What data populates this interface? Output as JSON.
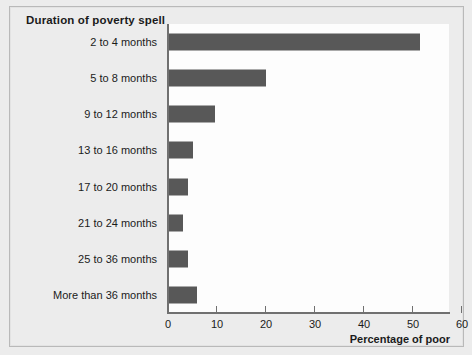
{
  "chart_data": {
    "type": "bar",
    "orientation": "horizontal",
    "title": "Duration of poverty spell",
    "xlabel": "Percentage of poor",
    "ylabel": "",
    "categories": [
      "2 to 4 months",
      "5 to 8 months",
      "9 to 12 months",
      "13 to 16 months",
      "17 to 20 months",
      "21 to 24 months",
      "25 to 36 months",
      "More than 36 months"
    ],
    "values": [
      51.5,
      20,
      9.5,
      5,
      4,
      3,
      4,
      6
    ],
    "xlim": [
      0,
      60
    ],
    "xticks": [
      0,
      10,
      20,
      30,
      40,
      50,
      60
    ],
    "xtick_labels": [
      "0",
      "10",
      "20",
      "30",
      "40",
      "50",
      "60"
    ],
    "grid": false,
    "legend": null,
    "bar_color": "#585858",
    "plot_background": "#fdfdfd",
    "figure_background": "#ececec",
    "axis_color": "#707070",
    "text_color": "#1b1b1b"
  }
}
